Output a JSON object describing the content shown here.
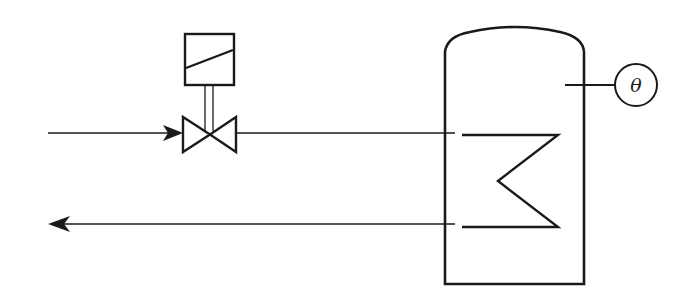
{
  "diagram": {
    "colors": {
      "stroke": "#1a1a1a",
      "background": "#ffffff"
    },
    "sensor": {
      "symbol": "θ",
      "label": "temperature-sensor"
    },
    "components": [
      {
        "id": "supply-line",
        "type": "pipe",
        "direction": "in"
      },
      {
        "id": "return-line",
        "type": "pipe",
        "direction": "out"
      },
      {
        "id": "solenoid-valve",
        "type": "valve",
        "actuator": "solenoid"
      },
      {
        "id": "storage-tank",
        "type": "vessel"
      },
      {
        "id": "heating-coil",
        "type": "coil"
      },
      {
        "id": "temperature-sensor",
        "type": "instrument",
        "symbol": "θ"
      }
    ]
  }
}
